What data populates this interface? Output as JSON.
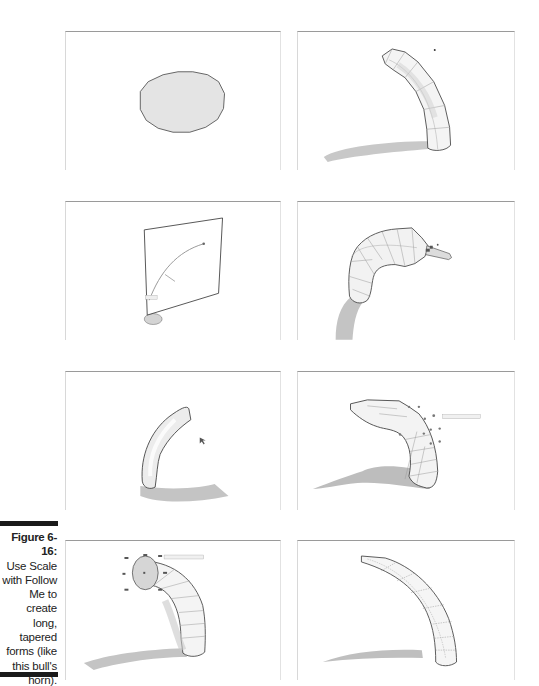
{
  "figure": {
    "label": "Figure 6-16:",
    "caption_lines": [
      "Use Scale",
      "with Follow",
      "Me to",
      "create long,",
      "tapered",
      "forms (like",
      "this bull's",
      "horn)."
    ]
  },
  "panels": [
    {
      "id": 1,
      "depicts": "circle face on ground"
    },
    {
      "id": 2,
      "depicts": "extruded bent tube with tapered end"
    },
    {
      "id": 3,
      "depicts": "vertical plane with arc path and circle"
    },
    {
      "id": 4,
      "depicts": "Follow Me tube with scale tool grips"
    },
    {
      "id": 5,
      "depicts": "curved tube extruded along arc"
    },
    {
      "id": 6,
      "depicts": "scaling grips on horn tip"
    },
    {
      "id": 7,
      "depicts": "scaling end face of tube"
    },
    {
      "id": 8,
      "depicts": "finished tapered bull's horn"
    }
  ],
  "colors": {
    "face_fill": "#e2e2e2",
    "shadow": "#c4c4c4",
    "edge": "#4a4a4a",
    "caption_bar": "#1a1a1a"
  }
}
